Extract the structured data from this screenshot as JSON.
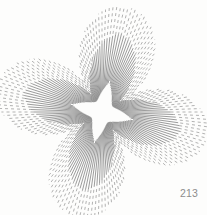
{
  "page": {
    "background_color": "#fdfdfc",
    "width": 207,
    "height": 215
  },
  "plate": {
    "number": "213"
  },
  "figure": {
    "title": "Radiating starburst with concave four-pointed star void",
    "type": "line-art",
    "ink_color": "#8a8a8a",
    "center": {
      "x": 102,
      "y": 112
    },
    "ray_count": 180,
    "inner_void": {
      "shape": "astroid",
      "radius_x": 32,
      "radius_y": 32,
      "concavity": 0.62,
      "rotation_deg": 14
    },
    "ray_extent": {
      "axis_max": 108,
      "diagonal_min": 34,
      "rotation_deg": 14
    },
    "stroke": {
      "width_inner": 0.85,
      "width_outer": 0.7,
      "dash_near": "solid",
      "dash_far": "3 3"
    }
  }
}
